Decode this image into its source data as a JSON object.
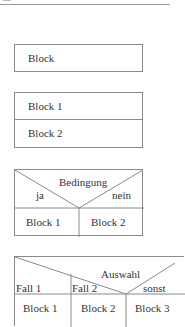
{
  "diagram": {
    "type": "Nassi-Shneiderman structogram elements",
    "simple_block": {
      "label": "Block"
    },
    "sequence": {
      "blocks": [
        "Block 1",
        "Block 2"
      ]
    },
    "condition": {
      "label": "Bedingung",
      "true_label": "ja",
      "false_label": "nein",
      "blocks": [
        "Block 1",
        "Block 2"
      ]
    },
    "switch": {
      "label": "Auswahl",
      "cases": [
        "Fall 1",
        "Fall 2",
        "sonst"
      ],
      "blocks": [
        "Block 1",
        "Block 2",
        "Block 3"
      ]
    }
  },
  "colors": {
    "line": "#8a8a8a",
    "text": "#333333",
    "background": "#ffffff"
  }
}
